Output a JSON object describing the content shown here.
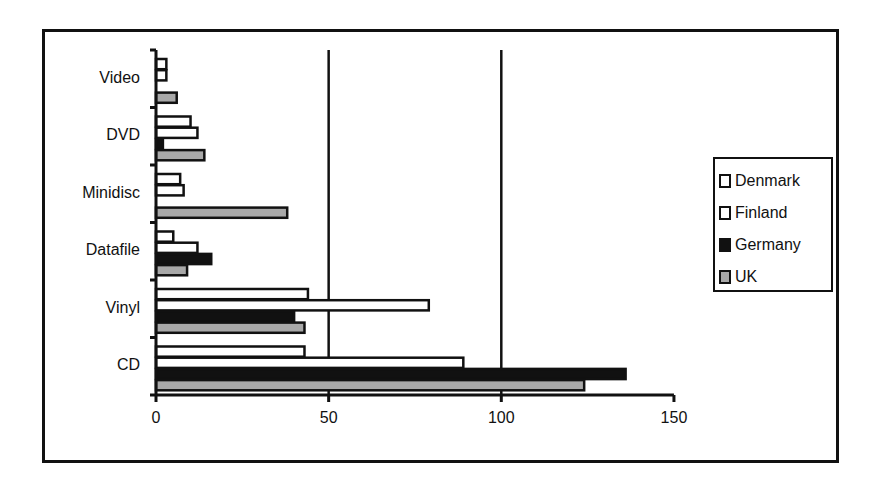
{
  "chart_data": {
    "type": "bar",
    "orientation": "horizontal",
    "title": "",
    "xlabel": "",
    "ylabel": "",
    "categories": [
      "Video",
      "DVD",
      "Minidisc",
      "Datafile",
      "Vinyl",
      "CD"
    ],
    "series": [
      {
        "name": "Denmark",
        "color": "#ffffff",
        "values": [
          3,
          10,
          7,
          5,
          44,
          43
        ]
      },
      {
        "name": "Finland",
        "color": "#ffffff",
        "values": [
          3,
          12,
          8,
          12,
          79,
          89
        ]
      },
      {
        "name": "Germany",
        "color": "#111111",
        "values": [
          0,
          2,
          0,
          16,
          40,
          136
        ]
      },
      {
        "name": "UK",
        "color": "#a8a8a8",
        "values": [
          6,
          14,
          38,
          9,
          43,
          124
        ]
      }
    ],
    "xlim": [
      0,
      150
    ],
    "x_ticks": [
      0,
      50,
      100,
      150
    ],
    "gridlines_x": [
      50,
      100
    ],
    "legend_position": "right"
  },
  "legend": {
    "items": [
      {
        "label": "Denmark",
        "color": "#ffffff"
      },
      {
        "label": "Finland",
        "color": "#ffffff"
      },
      {
        "label": "Germany",
        "color": "#111111"
      },
      {
        "label": "UK",
        "color": "#a8a8a8"
      }
    ]
  },
  "axis": {
    "x_ticks": [
      "0",
      "50",
      "100",
      "150"
    ],
    "categories": [
      "Video",
      "DVD",
      "Minidisc",
      "Datafile",
      "Vinyl",
      "CD"
    ]
  }
}
